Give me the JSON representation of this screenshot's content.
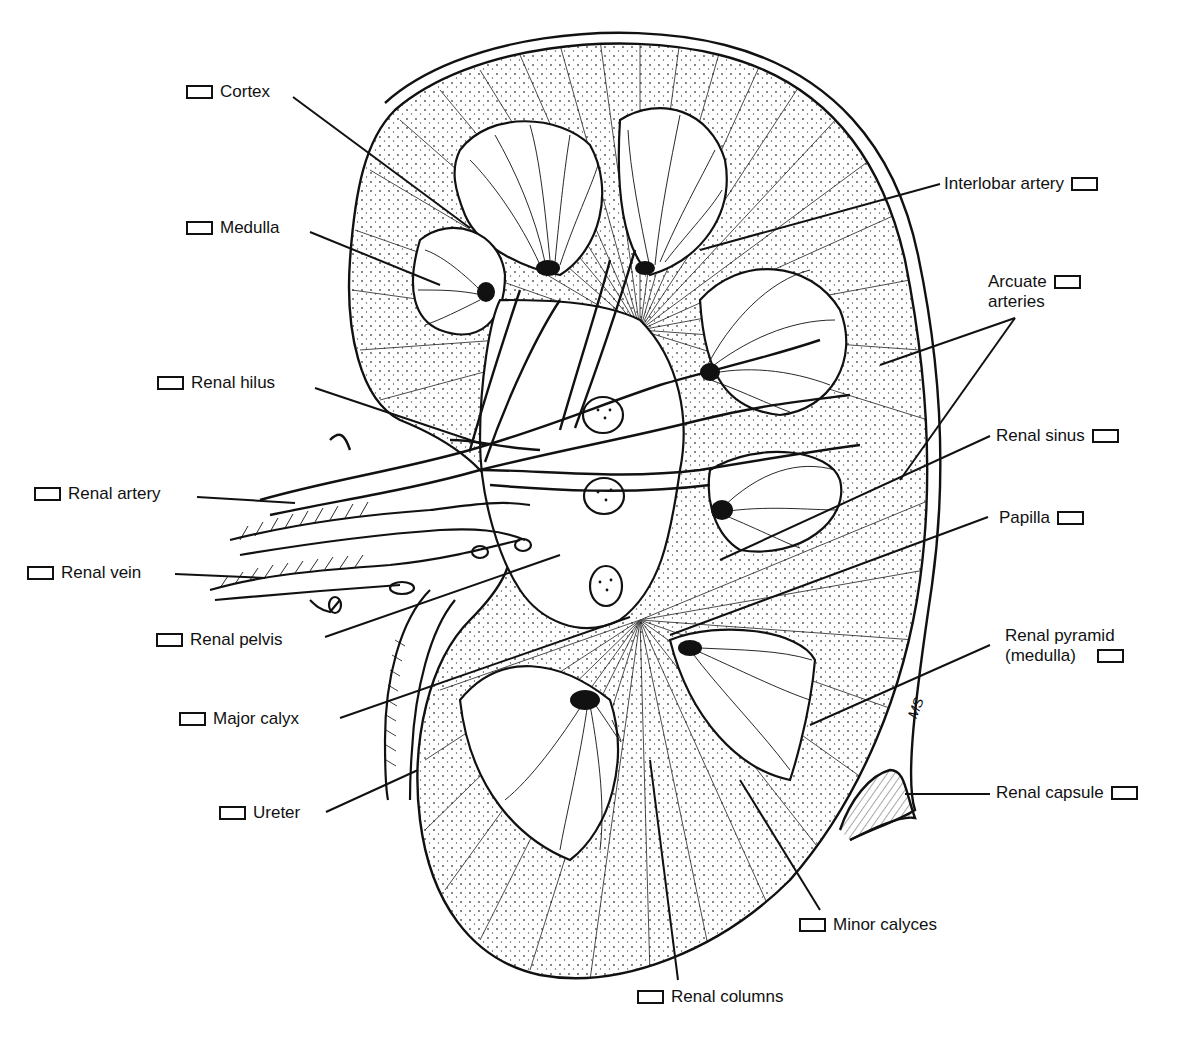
{
  "diagram": {
    "artist_initials": "MS",
    "labels": {
      "cortex": "Cortex",
      "medulla": "Medulla",
      "renal_hilus": "Renal hilus",
      "renal_artery": "Renal artery",
      "renal_vein": "Renal vein",
      "renal_pelvis": "Renal pelvis",
      "major_calyx": "Major calyx",
      "ureter": "Ureter",
      "interlobar_artery": "Interlobar artery",
      "arcuate_line1": "Arcuate",
      "arcuate_line2": "arteries",
      "renal_sinus": "Renal sinus",
      "papilla": "Papilla",
      "renal_pyramid_line1": "Renal pyramid",
      "renal_pyramid_line2": "(medulla)",
      "renal_capsule": "Renal capsule",
      "minor_calyces": "Minor calyces",
      "renal_columns": "Renal columns"
    },
    "colors": {
      "ink": "#111111",
      "paper": "#ffffff"
    }
  }
}
